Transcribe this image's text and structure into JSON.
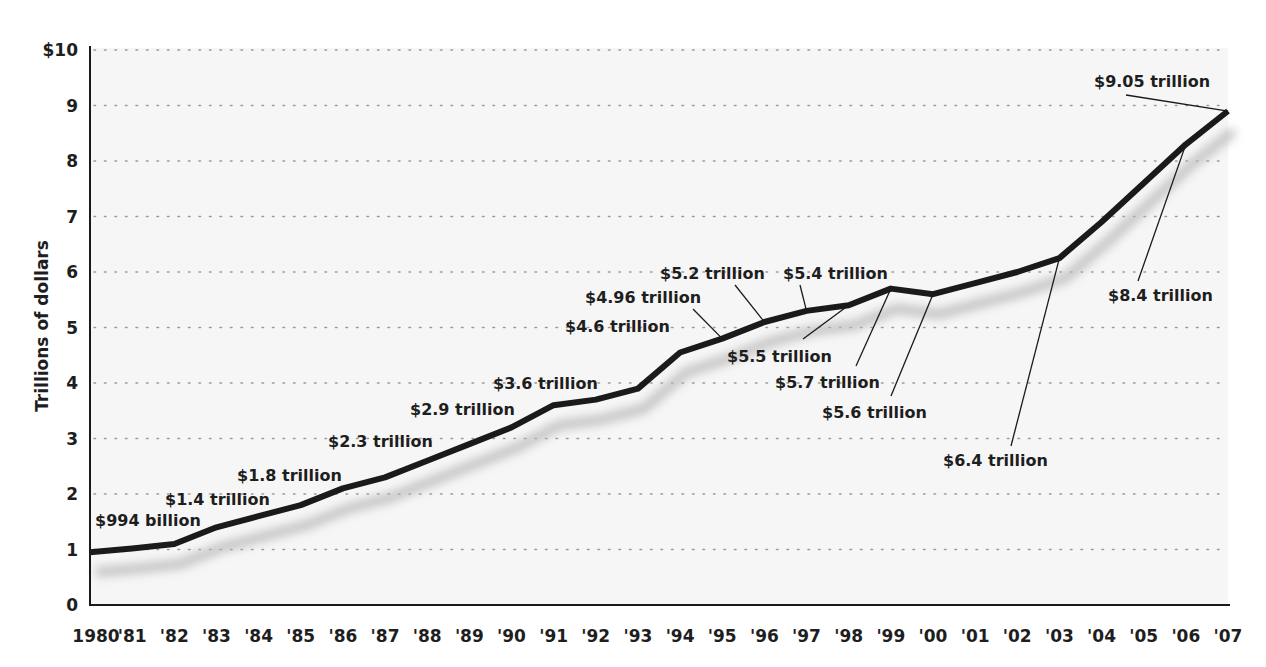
{
  "chart_data": {
    "type": "line",
    "title": "",
    "xlabel": "",
    "ylabel": "Trillions of dollars",
    "ylim": [
      0,
      10
    ],
    "y_ticks": [
      "0",
      "1",
      "2",
      "3",
      "4",
      "5",
      "6",
      "7",
      "8",
      "9",
      "$10"
    ],
    "x_tick_labels": [
      "1980",
      "'81",
      "'82",
      "'83",
      "'84",
      "'85",
      "'86",
      "'87",
      "'88",
      "'89",
      "'90",
      "'91",
      "'92",
      "'93",
      "'94",
      "'95",
      "'96",
      "'97",
      "'98",
      "'99",
      "'00",
      "'01",
      "'02",
      "'03",
      "'04",
      "'05",
      "'06",
      "'07"
    ],
    "grid": "horizontal dotted",
    "legend": "none",
    "x": [
      1980,
      1981,
      1982,
      1983,
      1984,
      1985,
      1986,
      1987,
      1988,
      1989,
      1990,
      1991,
      1992,
      1993,
      1994,
      1995,
      1996,
      1997,
      1998,
      1999,
      2000,
      2001,
      2002,
      2003,
      2004,
      2005,
      2006,
      2007
    ],
    "series": [
      {
        "name": "Total debt",
        "values": [
          0.95,
          1.02,
          1.1,
          1.4,
          1.6,
          1.8,
          2.1,
          2.3,
          2.6,
          2.9,
          3.2,
          3.6,
          3.7,
          3.9,
          4.55,
          4.8,
          5.1,
          5.3,
          5.4,
          5.7,
          5.6,
          5.8,
          6.0,
          6.25,
          6.9,
          7.6,
          8.3,
          8.9
        ]
      }
    ],
    "annotations": [
      {
        "text": "$994 billion",
        "year": 1980
      },
      {
        "text": "$1.4 trillion",
        "year": 1983
      },
      {
        "text": "$1.8 trillion",
        "year": 1985
      },
      {
        "text": "$2.3 trillion",
        "year": 1987
      },
      {
        "text": "$2.9 trillion",
        "year": 1989
      },
      {
        "text": "$3.6 trillion",
        "year": 1991
      },
      {
        "text": "$4.6 trillion",
        "year": 1994
      },
      {
        "text": "$4.96 trillion",
        "year": 1995
      },
      {
        "text": "$5.2 trillion",
        "year": 1996
      },
      {
        "text": "$5.4 trillion",
        "year": 1997
      },
      {
        "text": "$5.5 trillion",
        "year": 1998
      },
      {
        "text": "$5.7 trillion",
        "year": 1999
      },
      {
        "text": "$5.6 trillion",
        "year": 2000
      },
      {
        "text": "$6.4 trillion",
        "year": 2003
      },
      {
        "text": "$8.4 trillion",
        "year": 2006
      },
      {
        "text": "$9.05 trillion",
        "year": 2007
      }
    ]
  },
  "colors": {
    "line": "#1a1a1a",
    "shadow": "#b8b8b8",
    "grid": "#9a9a9a",
    "plot_bg": "#f6f6f6",
    "text": "#1e1e1e"
  }
}
